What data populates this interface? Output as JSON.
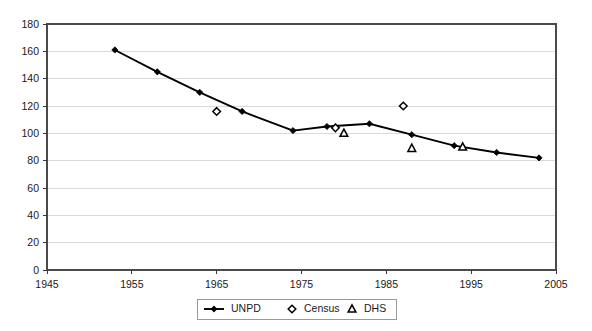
{
  "chart_data": {
    "type": "line",
    "title": "",
    "xlabel": "",
    "ylabel": "",
    "xlim": [
      1945,
      2005
    ],
    "ylim": [
      0,
      180
    ],
    "grid": "horizontal",
    "legend_position": "bottom-center",
    "x_ticks": [
      "1945",
      "1955",
      "1965",
      "1975",
      "1985",
      "1995",
      "2005"
    ],
    "x_tick_values": [
      1945,
      1955,
      1965,
      1975,
      1985,
      1995,
      2005
    ],
    "y_ticks": [
      "0",
      "20",
      "40",
      "60",
      "80",
      "100",
      "120",
      "140",
      "160",
      "180"
    ],
    "y_tick_values": [
      0,
      20,
      40,
      60,
      80,
      100,
      120,
      140,
      160,
      180
    ],
    "series": [
      {
        "name": "UNPD",
        "marker": "filled-diamond",
        "line": true,
        "x": [
          1953,
          1958,
          1963,
          1968,
          1974,
          1978,
          1983,
          1988,
          1993,
          1998,
          2003
        ],
        "values": [
          161,
          145,
          130,
          116,
          102,
          105,
          107,
          99,
          91,
          86,
          82
        ]
      },
      {
        "name": "Census",
        "marker": "hollow-diamond",
        "line": false,
        "x": [
          1965,
          1979,
          1987
        ],
        "values": [
          116,
          104,
          120
        ]
      },
      {
        "name": "DHS",
        "marker": "hollow-triangle",
        "line": false,
        "x": [
          1980,
          1988,
          1994
        ],
        "values": [
          100,
          89,
          90
        ]
      }
    ]
  },
  "legend": {
    "entries": [
      {
        "label": "UNPD",
        "marker": "line-with-filled-diamond"
      },
      {
        "label": "Census",
        "marker": "hollow-diamond"
      },
      {
        "label": "DHS",
        "marker": "hollow-triangle"
      }
    ]
  },
  "colors": {
    "series": "#000000",
    "grid": "#d9d9d9",
    "frame": "#4a4a4a",
    "text": "#1a1a1a",
    "background": "#ffffff"
  }
}
